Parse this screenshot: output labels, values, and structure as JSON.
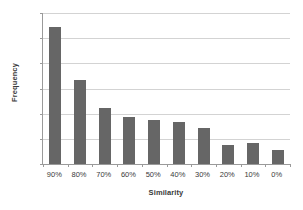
{
  "chart_data": {
    "type": "bar",
    "title": "",
    "xlabel": "Similarity",
    "ylabel": "Frequency",
    "categories": [
      "90%",
      "80%",
      "70%",
      "60%",
      "50%",
      "40%",
      "30%",
      "20%",
      "10%",
      "0%"
    ],
    "values": [
      27.2,
      16.6,
      11.2,
      9.3,
      8.7,
      8.3,
      7.2,
      3.7,
      4.1,
      2.7
    ],
    "ylim": [
      0,
      30
    ],
    "ytick_labels": [
      "0%",
      "5%",
      "10%",
      "15%",
      "20%",
      "25%",
      "30%"
    ],
    "ytick_values": [
      0,
      5,
      10,
      15,
      20,
      25,
      30
    ],
    "grid": true,
    "legend": false,
    "bar_color": "#666666",
    "gridline_color": "#d3d3d3",
    "axis_color": "#9a9a9a",
    "text_color": "#3a3a3a"
  }
}
